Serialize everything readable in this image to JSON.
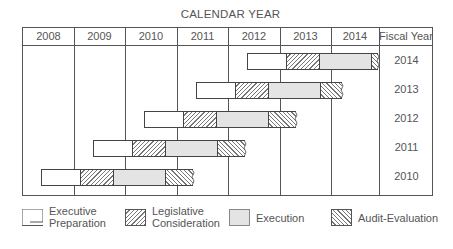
{
  "title": "CALENDAR YEAR",
  "header": {
    "years": [
      "2008",
      "2009",
      "2010",
      "2011",
      "2012",
      "2013",
      "2014"
    ],
    "fiscal_col": "Fiscal Year"
  },
  "rows": [
    {
      "fiscal_year": "2014"
    },
    {
      "fiscal_year": "2013"
    },
    {
      "fiscal_year": "2012"
    },
    {
      "fiscal_year": "2011"
    },
    {
      "fiscal_year": "2010"
    }
  ],
  "legend": {
    "executive": {
      "line1": "Executive",
      "line2": "Preparation"
    },
    "legislative": {
      "line1": "Legislative",
      "line2": "Consideration"
    },
    "execution": {
      "label": "Execution"
    },
    "audit": {
      "label": "Audit-Evaluation"
    }
  },
  "colors": {
    "line": "#555555",
    "execution_fill": "#e4e4e4",
    "hatch": "#777777"
  }
}
